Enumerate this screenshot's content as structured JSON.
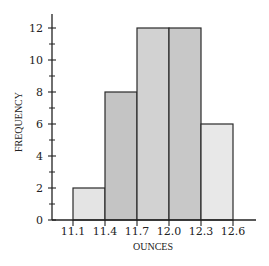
{
  "chart_data": {
    "type": "bar",
    "subtype": "histogram",
    "title": "",
    "xlabel": "OUNCES",
    "ylabel": "FREQUENCY",
    "bin_edges": [
      11.1,
      11.4,
      11.7,
      12.0,
      12.3,
      12.6
    ],
    "categories": [
      "11.1-11.4",
      "11.4-11.7",
      "11.7-12.0",
      "12.0-12.3",
      "12.3-12.6"
    ],
    "values": [
      2,
      8,
      12,
      12,
      6
    ],
    "x_tick_labels": [
      "11.1",
      "11.4",
      "11.7",
      "12.0",
      "12.3",
      "12.6"
    ],
    "y_tick_labels": [
      "0",
      "2",
      "4",
      "6",
      "8",
      "10",
      "12"
    ],
    "y_minor_ticks": [
      1,
      3,
      5,
      7,
      9,
      11
    ],
    "ylim": [
      0,
      12.8
    ],
    "xlim": [
      10.9,
      12.9
    ],
    "grid": false,
    "legend": null,
    "bar_colors": [
      "#e4e4e4",
      "#c4c4c4",
      "#d2d2d2",
      "#c8c8c8",
      "#e8e8e8"
    ]
  }
}
